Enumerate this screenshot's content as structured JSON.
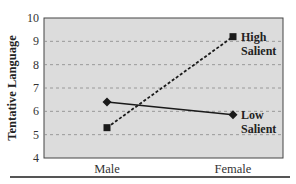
{
  "chart_data": {
    "type": "line",
    "title": "",
    "xlabel": "",
    "ylabel": "Tentative Language",
    "categories": [
      "Male",
      "Female"
    ],
    "ylim": [
      4,
      10
    ],
    "yticks": [
      4,
      5,
      6,
      7,
      8,
      9,
      10
    ],
    "grid": true,
    "series": [
      {
        "name": "High Salient",
        "label_lines": [
          "High",
          "Salient"
        ],
        "values": [
          5.3,
          9.2
        ],
        "line_style": "dashed",
        "marker": "square",
        "color": "#1a1a1a"
      },
      {
        "name": "Low Salient",
        "label_lines": [
          "Low",
          "Salient"
        ],
        "values": [
          6.4,
          5.85
        ],
        "line_style": "solid",
        "marker": "diamond",
        "color": "#1a1a1a"
      }
    ],
    "legend_position": "inline-right",
    "plot_background": "#dcdcdc"
  }
}
